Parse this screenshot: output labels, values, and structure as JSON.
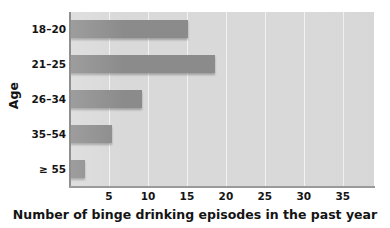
{
  "chart_data": {
    "type": "bar",
    "orientation": "horizontal",
    "title": "",
    "xlabel": "Number of binge drinking episodes in the past year",
    "ylabel": "Age",
    "categories": [
      "18–20",
      "21–25",
      "26–34",
      "35–54",
      "≥ 55"
    ],
    "values": [
      15.1,
      18.6,
      9.3,
      5.4,
      1.9
    ],
    "xlim": [
      0,
      39
    ],
    "ylim": [
      0,
      5
    ],
    "xticks": [
      5,
      10,
      15,
      20,
      25,
      30,
      35
    ],
    "xtick_labels": [
      "5",
      "10",
      "15",
      "20",
      "25",
      "30",
      "35"
    ],
    "grid": "vertical",
    "legend": "none",
    "colors": {
      "bar": "#8b8b8b",
      "plot_background": "#d9d9d9",
      "gridline": "#f2f2f2",
      "axis": "#8f8f8f",
      "text": "#141414",
      "page_background": "#ffffff"
    }
  }
}
